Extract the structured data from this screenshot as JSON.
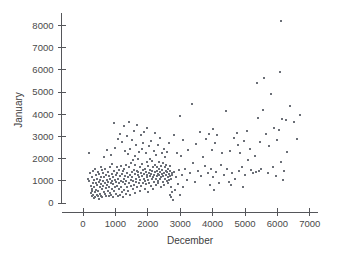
{
  "chart_data": {
    "type": "scatter",
    "title": "",
    "xlabel": "December",
    "ylabel": "January",
    "xlim": [
      -400,
      7400
    ],
    "ylim": [
      -300,
      8600
    ],
    "xticks": [
      0,
      1000,
      2000,
      3000,
      4000,
      5000,
      6000,
      7000
    ],
    "yticks": [
      0,
      1000,
      2000,
      3000,
      4000,
      5000,
      6000,
      7000,
      8000
    ],
    "xticklabels": [
      "0",
      "1000",
      "2000",
      "3000",
      "4000",
      "5000",
      "6000",
      "7000"
    ],
    "yticklabels": [
      "0",
      "1000",
      "2000",
      "3000",
      "4000",
      "5000",
      "6000",
      "7000",
      "8000"
    ],
    "grid": false,
    "legend": null,
    "marker_color": "#6b6f77",
    "marker_size": 2,
    "n_points": 360,
    "points": [
      [
        170,
        2250
      ],
      [
        150,
        1100
      ],
      [
        200,
        980
      ],
      [
        230,
        1350
      ],
      [
        240,
        760
      ],
      [
        255,
        430
      ],
      [
        265,
        300
      ],
      [
        270,
        640
      ],
      [
        280,
        1180
      ],
      [
        290,
        520
      ],
      [
        300,
        880
      ],
      [
        310,
        350
      ],
      [
        320,
        1450
      ],
      [
        330,
        240
      ],
      [
        340,
        700
      ],
      [
        350,
        1020
      ],
      [
        360,
        480
      ],
      [
        370,
        1550
      ],
      [
        380,
        260
      ],
      [
        390,
        900
      ],
      [
        400,
        600
      ],
      [
        410,
        1250
      ],
      [
        420,
        380
      ],
      [
        430,
        820
      ],
      [
        440,
        1100
      ],
      [
        450,
        300
      ],
      [
        460,
        1400
      ],
      [
        470,
        560
      ],
      [
        480,
        950
      ],
      [
        490,
        200
      ],
      [
        500,
        1300
      ],
      [
        510,
        700
      ],
      [
        520,
        1050
      ],
      [
        530,
        420
      ],
      [
        540,
        1600
      ],
      [
        550,
        860
      ],
      [
        560,
        330
      ],
      [
        570,
        1180
      ],
      [
        580,
        620
      ],
      [
        590,
        1480
      ],
      [
        600,
        250
      ],
      [
        610,
        1000
      ],
      [
        620,
        780
      ],
      [
        630,
        1350
      ],
      [
        640,
        500
      ],
      [
        650,
        2050
      ],
      [
        660,
        1150
      ],
      [
        670,
        400
      ],
      [
        680,
        900
      ],
      [
        690,
        1550
      ],
      [
        700,
        680
      ],
      [
        710,
        1250
      ],
      [
        720,
        330
      ],
      [
        730,
        1050
      ],
      [
        740,
        820
      ],
      [
        750,
        2400
      ],
      [
        760,
        560
      ],
      [
        770,
        1400
      ],
      [
        780,
        950
      ],
      [
        790,
        300
      ],
      [
        800,
        1200
      ],
      [
        810,
        700
      ],
      [
        820,
        1600
      ],
      [
        830,
        450
      ],
      [
        840,
        1080
      ],
      [
        850,
        880
      ],
      [
        860,
        2150
      ],
      [
        870,
        380
      ],
      [
        880,
        1320
      ],
      [
        890,
        1000
      ],
      [
        900,
        620
      ],
      [
        910,
        1750
      ],
      [
        920,
        260
      ],
      [
        930,
        1150
      ],
      [
        940,
        850
      ],
      [
        950,
        1450
      ],
      [
        960,
        520
      ],
      [
        970,
        3600
      ],
      [
        980,
        1050
      ],
      [
        990,
        700
      ],
      [
        1000,
        2500
      ],
      [
        1010,
        1250
      ],
      [
        1020,
        400
      ],
      [
        1030,
        950
      ],
      [
        1040,
        1600
      ],
      [
        1050,
        780
      ],
      [
        1060,
        1350
      ],
      [
        1070,
        300
      ],
      [
        1080,
        2900
      ],
      [
        1090,
        1100
      ],
      [
        1100,
        620
      ],
      [
        1110,
        1500
      ],
      [
        1120,
        880
      ],
      [
        1130,
        350
      ],
      [
        1140,
        1200
      ],
      [
        1150,
        3100
      ],
      [
        1160,
        1000
      ],
      [
        1170,
        720
      ],
      [
        1180,
        1650
      ],
      [
        1190,
        480
      ],
      [
        1200,
        2750
      ],
      [
        1210,
        1300
      ],
      [
        1220,
        930
      ],
      [
        1230,
        250
      ],
      [
        1240,
        1420
      ],
      [
        1250,
        1080
      ],
      [
        1260,
        3450
      ],
      [
        1270,
        600
      ],
      [
        1280,
        1550
      ],
      [
        1290,
        850
      ],
      [
        1300,
        2350
      ],
      [
        1310,
        1200
      ],
      [
        1320,
        420
      ],
      [
        1330,
        1700
      ],
      [
        1340,
        980
      ],
      [
        1350,
        3000
      ],
      [
        1360,
        1350
      ],
      [
        1370,
        700
      ],
      [
        1380,
        2200
      ],
      [
        1390,
        1150
      ],
      [
        1400,
        530
      ],
      [
        1410,
        1600
      ],
      [
        1420,
        900
      ],
      [
        1430,
        3650
      ],
      [
        1440,
        1250
      ],
      [
        1450,
        380
      ],
      [
        1460,
        2450
      ],
      [
        1470,
        1050
      ],
      [
        1480,
        1800
      ],
      [
        1490,
        750
      ],
      [
        1500,
        1400
      ],
      [
        1510,
        2850
      ],
      [
        1520,
        1150
      ],
      [
        1530,
        620
      ],
      [
        1540,
        1950
      ],
      [
        1550,
        1000
      ],
      [
        1560,
        3250
      ],
      [
        1570,
        1500
      ],
      [
        1580,
        820
      ],
      [
        1590,
        2100
      ],
      [
        1600,
        1300
      ],
      [
        1610,
        450
      ],
      [
        1620,
        1700
      ],
      [
        1630,
        1100
      ],
      [
        1640,
        2600
      ],
      [
        1650,
        950
      ],
      [
        1660,
        1450
      ],
      [
        1670,
        3500
      ],
      [
        1680,
        700
      ],
      [
        1690,
        1250
      ],
      [
        1700,
        2000
      ],
      [
        1710,
        1380
      ],
      [
        1720,
        880
      ],
      [
        1730,
        2300
      ],
      [
        1740,
        1150
      ],
      [
        1750,
        550
      ],
      [
        1760,
        1620
      ],
      [
        1770,
        1020
      ],
      [
        1780,
        3050
      ],
      [
        1790,
        1350
      ],
      [
        1800,
        780
      ],
      [
        1810,
        2450
      ],
      [
        1820,
        1200
      ],
      [
        1830,
        1750
      ],
      [
        1840,
        920
      ],
      [
        1850,
        1480
      ],
      [
        1860,
        2700
      ],
      [
        1870,
        1100
      ],
      [
        1880,
        3200
      ],
      [
        1890,
        1300
      ],
      [
        1900,
        650
      ],
      [
        1910,
        1550
      ],
      [
        1920,
        1000
      ],
      [
        1930,
        2250
      ],
      [
        1940,
        1400
      ],
      [
        1950,
        850
      ],
      [
        1960,
        1850
      ],
      [
        1970,
        1150
      ],
      [
        1980,
        3400
      ],
      [
        1990,
        1250
      ],
      [
        2000,
        500
      ],
      [
        2010,
        1650
      ],
      [
        2020,
        1050
      ],
      [
        2030,
        2550
      ],
      [
        2040,
        1350
      ],
      [
        2050,
        900
      ],
      [
        2060,
        2000
      ],
      [
        2070,
        1200
      ],
      [
        2080,
        1500
      ],
      [
        2090,
        750
      ],
      [
        2100,
        2800
      ],
      [
        2110,
        1300
      ],
      [
        2120,
        1080
      ],
      [
        2130,
        1900
      ],
      [
        2140,
        1420
      ],
      [
        2150,
        620
      ],
      [
        2160,
        1600
      ],
      [
        2170,
        1150
      ],
      [
        2180,
        2350
      ],
      [
        2190,
        1250
      ],
      [
        2200,
        950
      ],
      [
        2210,
        1700
      ],
      [
        2220,
        1380
      ],
      [
        2230,
        3150
      ],
      [
        2240,
        1100
      ],
      [
        2250,
        800
      ],
      [
        2260,
        2150
      ],
      [
        2270,
        1450
      ],
      [
        2280,
        1200
      ],
      [
        2290,
        1620
      ],
      [
        2300,
        1000
      ],
      [
        2310,
        2600
      ],
      [
        2320,
        1320
      ],
      [
        2330,
        880
      ],
      [
        2340,
        1550
      ],
      [
        2350,
        1250
      ],
      [
        2360,
        1850
      ],
      [
        2370,
        1080
      ],
      [
        2380,
        2950
      ],
      [
        2390,
        1400
      ],
      [
        2400,
        700
      ],
      [
        2410,
        1650
      ],
      [
        2420,
        1150
      ],
      [
        2430,
        2250
      ],
      [
        2440,
        1300
      ],
      [
        2450,
        1500
      ],
      [
        2460,
        950
      ],
      [
        2470,
        1780
      ],
      [
        2480,
        1200
      ],
      [
        2490,
        2450
      ],
      [
        2500,
        1350
      ],
      [
        2510,
        820
      ],
      [
        2520,
        1600
      ],
      [
        2530,
        1100
      ],
      [
        2540,
        2050
      ],
      [
        2550,
        1450
      ],
      [
        2560,
        1250
      ],
      [
        2570,
        1700
      ],
      [
        2580,
        980
      ],
      [
        2590,
        2300
      ],
      [
        2600,
        1380
      ],
      [
        2610,
        1150
      ],
      [
        2620,
        1550
      ],
      [
        2630,
        900
      ],
      [
        2640,
        2700
      ],
      [
        2650,
        1300
      ],
      [
        2660,
        1020
      ],
      [
        2670,
        1650
      ],
      [
        2680,
        1200
      ],
      [
        2690,
        380
      ],
      [
        2700,
        1450
      ],
      [
        2710,
        250
      ],
      [
        2720,
        1100
      ],
      [
        2730,
        700
      ],
      [
        2740,
        1350
      ],
      [
        2750,
        480
      ],
      [
        2760,
        1250
      ],
      [
        2780,
        150
      ],
      [
        2800,
        3050
      ],
      [
        2820,
        1400
      ],
      [
        2850,
        600
      ],
      [
        2880,
        1150
      ],
      [
        2900,
        2250
      ],
      [
        2920,
        850
      ],
      [
        2950,
        1500
      ],
      [
        2980,
        350
      ],
      [
        3000,
        3900
      ],
      [
        3020,
        2100
      ],
      [
        3050,
        1250
      ],
      [
        3080,
        700
      ],
      [
        3100,
        2850
      ],
      [
        3150,
        1550
      ],
      [
        3200,
        1050
      ],
      [
        3250,
        2400
      ],
      [
        3300,
        1350
      ],
      [
        3350,
        4450
      ],
      [
        3400,
        1800
      ],
      [
        3450,
        950
      ],
      [
        3500,
        2650
      ],
      [
        3550,
        1450
      ],
      [
        3600,
        3200
      ],
      [
        3650,
        1200
      ],
      [
        3700,
        2050
      ],
      [
        3750,
        1650
      ],
      [
        3800,
        2900
      ],
      [
        3850,
        1350
      ],
      [
        3900,
        3100
      ],
      [
        3920,
        800
      ],
      [
        3950,
        1550
      ],
      [
        3980,
        2400
      ],
      [
        4000,
        3350
      ],
      [
        4020,
        1150
      ],
      [
        4050,
        600
      ],
      [
        4080,
        2700
      ],
      [
        4100,
        1400
      ],
      [
        4150,
        3050
      ],
      [
        4200,
        900
      ],
      [
        4250,
        1700
      ],
      [
        4300,
        2250
      ],
      [
        4350,
        1250
      ],
      [
        4400,
        4150
      ],
      [
        4450,
        1550
      ],
      [
        4500,
        950
      ],
      [
        4550,
        2350
      ],
      [
        4580,
        800
      ],
      [
        4600,
        1350
      ],
      [
        4650,
        2950
      ],
      [
        4700,
        1100
      ],
      [
        4750,
        3150
      ],
      [
        4780,
        2600
      ],
      [
        4800,
        1450
      ],
      [
        4850,
        2250
      ],
      [
        4900,
        1600
      ],
      [
        4950,
        700
      ],
      [
        4980,
        2800
      ],
      [
        5000,
        1250
      ],
      [
        5050,
        3250
      ],
      [
        5100,
        1950
      ],
      [
        5150,
        2450
      ],
      [
        5200,
        1500
      ],
      [
        5250,
        1350
      ],
      [
        5300,
        2100
      ],
      [
        5350,
        1400
      ],
      [
        5380,
        5400
      ],
      [
        5400,
        3850
      ],
      [
        5420,
        1450
      ],
      [
        5450,
        2750
      ],
      [
        5500,
        1550
      ],
      [
        5550,
        4200
      ],
      [
        5600,
        5650
      ],
      [
        5650,
        3100
      ],
      [
        5700,
        1350
      ],
      [
        5750,
        2550
      ],
      [
        5800,
        4900
      ],
      [
        5850,
        1600
      ],
      [
        5900,
        3400
      ],
      [
        5950,
        1200
      ],
      [
        6000,
        2850
      ],
      [
        6050,
        3300
      ],
      [
        6080,
        5900
      ],
      [
        6100,
        1850
      ],
      [
        6120,
        8200
      ],
      [
        6150,
        3800
      ],
      [
        6180,
        1050
      ],
      [
        6200,
        1450
      ],
      [
        6250,
        3750
      ],
      [
        6300,
        2300
      ],
      [
        6400,
        4350
      ],
      [
        6500,
        3650
      ],
      [
        6600,
        2900
      ],
      [
        6700,
        3950
      ]
    ]
  }
}
